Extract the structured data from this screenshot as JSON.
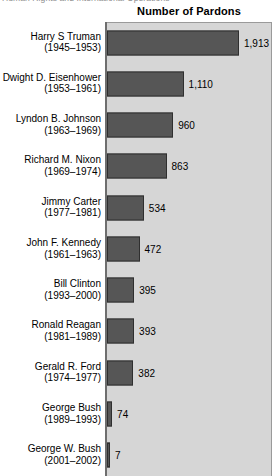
{
  "page": {
    "cut_header_text": "Human Rights and International Operations"
  },
  "chart_data": {
    "type": "bar",
    "orientation": "horizontal",
    "title": "Number of Pardons",
    "xlabel": "",
    "ylabel": "",
    "grid": false,
    "legend": null,
    "value_labels_shown": true,
    "xlim": [
      0,
      2000
    ],
    "categories": [
      "Harry S Truman (1945–1953)",
      "Dwight D. Eisenhower (1953–1961)",
      "Lyndon B. Johnson (1963–1969)",
      "Richard M. Nixon (1969–1974)",
      "Jimmy Carter (1977–1981)",
      "John F. Kennedy (1961–1963)",
      "Bill Clinton (1993–2000)",
      "Ronald Reagan (1981–1989)",
      "Gerald R. Ford (1974–1977)",
      "George Bush (1989–1993)",
      "George W. Bush (2001–2002)"
    ],
    "values": [
      1913,
      1110,
      960,
      863,
      534,
      472,
      395,
      393,
      382,
      74,
      7
    ],
    "rows": [
      {
        "name": "Harry S Truman",
        "years": "(1945–1953)",
        "value": 1913,
        "value_label": "1,913"
      },
      {
        "name": "Dwight D. Eisenhower",
        "years": "(1953–1961)",
        "value": 1110,
        "value_label": "1,110"
      },
      {
        "name": "Lyndon B. Johnson",
        "years": "(1963–1969)",
        "value": 960,
        "value_label": "960"
      },
      {
        "name": "Richard M. Nixon",
        "years": "(1969–1974)",
        "value": 863,
        "value_label": "863"
      },
      {
        "name": "Jimmy Carter",
        "years": "(1977–1981)",
        "value": 534,
        "value_label": "534"
      },
      {
        "name": "John F. Kennedy",
        "years": "(1961–1963)",
        "value": 472,
        "value_label": "472"
      },
      {
        "name": "Bill Clinton",
        "years": "(1993–2000)",
        "value": 395,
        "value_label": "395"
      },
      {
        "name": "Ronald Reagan",
        "years": "(1981–1989)",
        "value": 393,
        "value_label": "393"
      },
      {
        "name": "Gerald R. Ford",
        "years": "(1974–1977)",
        "value": 382,
        "value_label": "382"
      },
      {
        "name": "George Bush",
        "years": "(1989–1993)",
        "value": 74,
        "value_label": "74"
      },
      {
        "name": "George W. Bush",
        "years": "(2001–2002)",
        "value": 7,
        "value_label": "7"
      }
    ],
    "colors": {
      "bar_fill": "#565656",
      "bar_edge": "#2f2f2f",
      "plot_background": "#d6d6d6",
      "page_background": "#ffffff",
      "axis": "#6e6e6e",
      "text": "#000000"
    }
  }
}
